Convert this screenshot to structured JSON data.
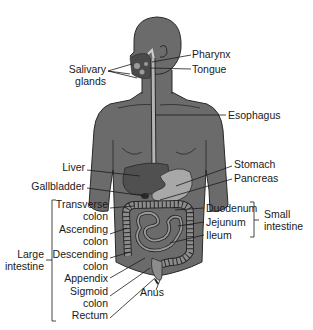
{
  "colors": {
    "body": "#6b6b6b",
    "body_outline": "#2a2a2a",
    "organ_dark": "#505050",
    "organ_light": "#a8a8a8",
    "esophagus": "#b5b5b5",
    "intestine": "#8c8c8c",
    "leader": "#1a1a1a"
  },
  "labels": {
    "pharynx": "Pharynx",
    "tongue": "Tongue",
    "salivary_1": "Salivary",
    "salivary_2": "glands",
    "esophagus": "Esophagus",
    "liver": "Liver",
    "gallbladder": "Gallbladder",
    "stomach": "Stomach",
    "pancreas": "Pancreas",
    "transverse_1": "Transverse",
    "transverse_2": "colon",
    "ascending_1": "Ascending",
    "ascending_2": "colon",
    "descending_1": "Descending",
    "descending_2": "colon",
    "appendix": "Appendix",
    "sigmoid_1": "Sigmoid",
    "sigmoid_2": "colon",
    "rectum": "Rectum",
    "anus": "Anus",
    "duodenum": "Duodenum",
    "jejunum": "Jejunum",
    "ileum": "Ileum",
    "small_intestine_1": "Small",
    "small_intestine_2": "intestine",
    "large_intestine_1": "Large",
    "large_intestine_2": "intestine"
  }
}
